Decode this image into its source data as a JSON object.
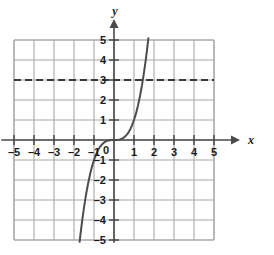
{
  "chart_data": {
    "type": "line",
    "title": "",
    "xlabel": "x",
    "ylabel": "y",
    "xlim": [
      -5,
      5
    ],
    "ylim": [
      -5,
      5
    ],
    "grid": true,
    "legend": "none",
    "x_ticks": [
      -5,
      -4,
      -3,
      -2,
      -1,
      1,
      2,
      3,
      4,
      5
    ],
    "y_ticks": [
      -5,
      -4,
      -3,
      -2,
      -1,
      1,
      2,
      3,
      4,
      5
    ],
    "x_tick_labels": [
      "–5",
      "–4",
      "–3",
      "–2",
      "–1",
      "1",
      "2",
      "3",
      "4",
      "5"
    ],
    "y_tick_labels": [
      "–5",
      "–4",
      "–3",
      "–2",
      "–1",
      "1",
      "2",
      "3",
      "4",
      "5"
    ],
    "origin_label": "0",
    "series": [
      {
        "name": "cubic-curve",
        "type": "line",
        "style": "solid",
        "color": "#4d4d4d",
        "x": [
          -1.72,
          -1.65,
          -1.58,
          -1.5,
          -1.4,
          -1.3,
          -1.2,
          -1.1,
          -1.0,
          -0.9,
          -0.8,
          -0.7,
          -0.6,
          -0.5,
          -0.4,
          -0.3,
          -0.2,
          -0.1,
          0.0,
          0.1,
          0.2,
          0.3,
          0.4,
          0.5,
          0.6,
          0.7,
          0.8,
          0.9,
          1.0,
          1.1,
          1.2,
          1.3,
          1.4,
          1.5,
          1.58,
          1.65,
          1.72
        ],
        "y": [
          -5.09,
          -4.49,
          -3.94,
          -3.38,
          -2.74,
          -2.2,
          -1.73,
          -1.33,
          -1.0,
          -0.73,
          -0.51,
          -0.34,
          -0.22,
          -0.13,
          -0.06,
          -0.03,
          -0.01,
          0.0,
          0.0,
          0.0,
          0.01,
          0.03,
          0.06,
          0.13,
          0.22,
          0.34,
          0.51,
          0.73,
          1.0,
          1.33,
          1.73,
          2.2,
          2.74,
          3.38,
          3.94,
          4.49,
          5.09
        ]
      },
      {
        "name": "horizontal-dashed-line",
        "type": "line",
        "style": "dashed",
        "color": "#3a3a3a",
        "constant_y": 3,
        "x": [
          -5,
          5
        ],
        "y": [
          3,
          3
        ]
      }
    ],
    "annotations": []
  },
  "axes": {
    "x_axis_name": "x",
    "y_axis_name": "y"
  },
  "colors": {
    "grid": "#a8a8a8",
    "axis": "#4a4a4a",
    "curve": "#4d4d4d",
    "dashed": "#3a3a3a",
    "background": "#ffffff"
  }
}
